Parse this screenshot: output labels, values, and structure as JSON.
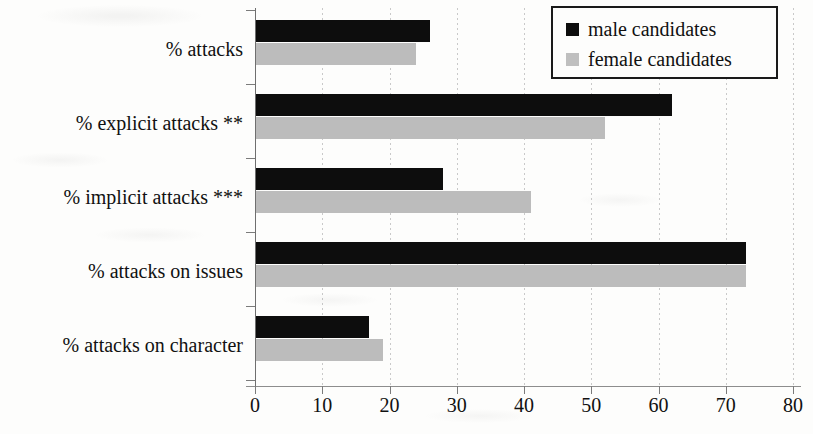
{
  "chart_data": {
    "type": "bar",
    "orientation": "horizontal",
    "title": "",
    "xlabel": "",
    "ylabel": "",
    "xlim": [
      0,
      80
    ],
    "xticks": [
      0,
      10,
      20,
      30,
      40,
      50,
      60,
      70,
      80
    ],
    "grid": true,
    "grid_axis": "x",
    "legend_position": "top-right",
    "categories": [
      "% attacks",
      "% explicit attacks **",
      "% implicit attacks ***",
      "% attacks on issues",
      "% attacks on character"
    ],
    "series": [
      {
        "name": "male candidates",
        "color": "#0d0d0d",
        "values": [
          26,
          62,
          28,
          73,
          17
        ]
      },
      {
        "name": "female candidates",
        "color": "#bcbcbc",
        "values": [
          24,
          52,
          41,
          73,
          19
        ]
      }
    ]
  },
  "legend": {
    "entries": [
      {
        "label": "male candidates",
        "swatch": "male"
      },
      {
        "label": "female candidates",
        "swatch": "female"
      }
    ]
  },
  "axis": {
    "x_tick_labels": [
      "0",
      "10",
      "20",
      "30",
      "40",
      "50",
      "60",
      "70",
      "80"
    ]
  }
}
